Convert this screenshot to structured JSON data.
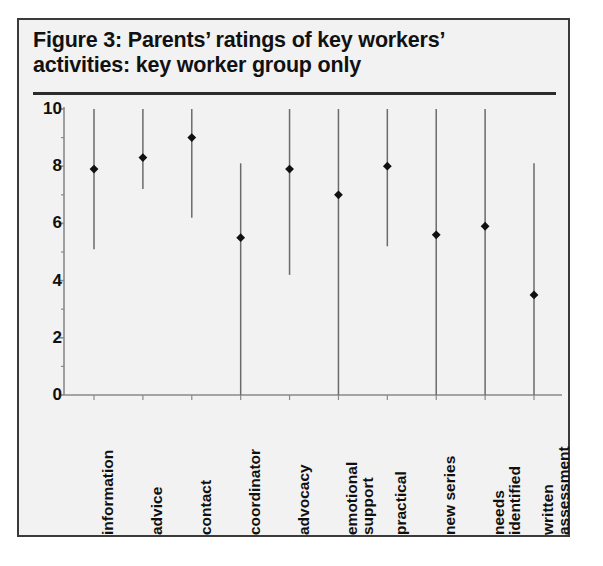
{
  "figure": {
    "title_line1": "Figure 3: Parents’ ratings of key workers’",
    "title_line2": "activities: key worker group only"
  },
  "axis": {
    "y_ticks": [
      "0",
      "2",
      "4",
      "6",
      "8",
      "10"
    ],
    "y_minor_present": true
  },
  "colors": {
    "background": "#f2f2f2",
    "border": "#3a3a3a",
    "text": "#101010",
    "whisker": "#6b6b6b",
    "marker": "#111111",
    "axis": "#8a8a8a",
    "rule": "#2b2b2b"
  },
  "chart_data": {
    "type": "scatter",
    "title": "Figure 3: Parents’ ratings of key workers’ activities: key worker group only",
    "xlabel": "",
    "ylabel": "",
    "ylim": [
      0,
      10
    ],
    "yticks": [
      0,
      2,
      4,
      6,
      8,
      10
    ],
    "grid": false,
    "legend": "none",
    "marker_meaning": "median rating",
    "range_meaning": "range of parents’ ratings (min to max)",
    "categories": [
      "information",
      "advice",
      "contact",
      "coordinator",
      "advocacy",
      "emotional support",
      "practical",
      "new series",
      "needs identified",
      "written assessment"
    ],
    "category_labels_rotated_deg": 90,
    "series": [
      {
        "name": "median",
        "values": [
          7.9,
          8.3,
          9.0,
          5.5,
          7.9,
          7.0,
          8.0,
          5.6,
          5.9,
          3.5
        ]
      },
      {
        "name": "range_low",
        "values": [
          5.1,
          7.2,
          6.2,
          0.0,
          4.2,
          0.0,
          5.2,
          0.0,
          0.0,
          0.0
        ]
      },
      {
        "name": "range_high",
        "values": [
          10.0,
          10.0,
          10.0,
          8.1,
          10.0,
          10.0,
          10.0,
          10.0,
          10.0,
          8.1
        ]
      }
    ],
    "points": [
      {
        "category": "information",
        "median": 7.9,
        "low": 5.1,
        "high": 10.0
      },
      {
        "category": "advice",
        "median": 8.3,
        "low": 7.2,
        "high": 10.0
      },
      {
        "category": "contact",
        "median": 9.0,
        "low": 6.2,
        "high": 10.0
      },
      {
        "category": "coordinator",
        "median": 5.5,
        "low": 0.0,
        "high": 8.1
      },
      {
        "category": "advocacy",
        "median": 7.9,
        "low": 4.2,
        "high": 10.0
      },
      {
        "category": "emotional support",
        "median": 7.0,
        "low": 0.0,
        "high": 10.0
      },
      {
        "category": "practical",
        "median": 8.0,
        "low": 5.2,
        "high": 10.0
      },
      {
        "category": "new series",
        "median": 5.6,
        "low": 0.0,
        "high": 10.0
      },
      {
        "category": "needs identified",
        "median": 5.9,
        "low": 0.0,
        "high": 10.0
      },
      {
        "category": "written assessment",
        "median": 3.5,
        "low": 0.0,
        "high": 8.1
      }
    ]
  }
}
